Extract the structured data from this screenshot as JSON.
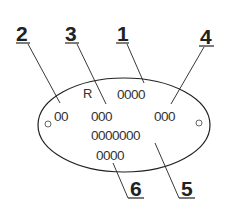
{
  "diagram": {
    "plate": {
      "marking_prefix": "R",
      "fields": {
        "field_1": "0000",
        "field_2": "00",
        "field_3": "000",
        "field_4": "000",
        "field_5": "0000000",
        "field_6": "0000"
      },
      "mounting_holes": 2
    },
    "callouts": [
      {
        "id": "1",
        "label": "1"
      },
      {
        "id": "2",
        "label": "2"
      },
      {
        "id": "3",
        "label": "3"
      },
      {
        "id": "4",
        "label": "4"
      },
      {
        "id": "5",
        "label": "5"
      },
      {
        "id": "6",
        "label": "6"
      }
    ],
    "colors": {
      "line": "#222222",
      "background": "#ffffff"
    }
  }
}
